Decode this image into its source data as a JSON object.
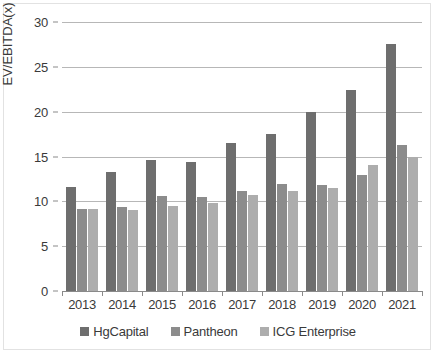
{
  "chart_data": {
    "type": "bar",
    "title": "",
    "subtitle": "",
    "xlabel": "",
    "ylabel": "EV/EBITDA(x)",
    "categories": [
      "2013",
      "2014",
      "2015",
      "2016",
      "2017",
      "2018",
      "2019",
      "2020",
      "2021"
    ],
    "series": [
      {
        "name": "HgCapital",
        "color": "#6e6e6e",
        "values": [
          11.6,
          13.3,
          14.6,
          14.4,
          16.5,
          17.5,
          20.0,
          22.4,
          27.6
        ]
      },
      {
        "name": "Pantheon",
        "color": "#8c8c8c",
        "values": [
          9.1,
          9.4,
          10.6,
          10.5,
          11.1,
          11.9,
          11.8,
          12.9,
          16.3
        ]
      },
      {
        "name": "ICG Enterprise",
        "color": "#adadad",
        "values": [
          9.1,
          9.0,
          9.5,
          9.8,
          10.7,
          11.2,
          11.5,
          14.1,
          14.9
        ]
      }
    ],
    "ylim": [
      0,
      30
    ],
    "y_ticks": [
      0,
      5,
      10,
      15,
      20,
      25,
      30
    ],
    "grid": true,
    "legend_position": "bottom"
  },
  "legend": {
    "items": [
      {
        "label": "HgCapital",
        "color": "#6e6e6e"
      },
      {
        "label": "Pantheon",
        "color": "#8c8c8c"
      },
      {
        "label": "ICG Enterprise",
        "color": "#adadad"
      }
    ]
  }
}
